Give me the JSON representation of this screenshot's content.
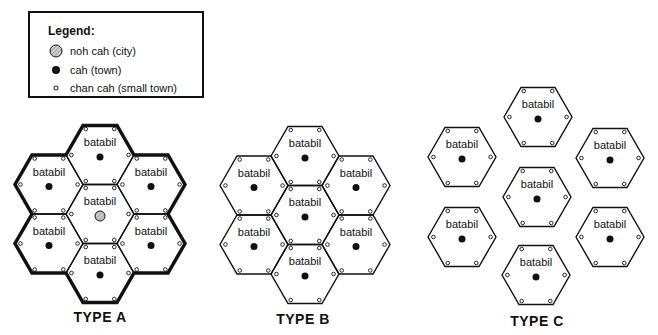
{
  "legend": {
    "title": "Legend:",
    "items": [
      {
        "symbol": "hatched-circle",
        "label": "noh cah (city)"
      },
      {
        "symbol": "filled-dot",
        "label": "cah (town)"
      },
      {
        "symbol": "open-small-circle",
        "label": "chan cah (small town)"
      }
    ]
  },
  "hex_label": "batabil",
  "types": [
    {
      "label": "TYPE A",
      "description": "7 contiguous hexagons, thick outer boundary, central city (noh cah)"
    },
    {
      "label": "TYPE B",
      "description": "7 contiguous hexagons, central town (cah)"
    },
    {
      "label": "TYPE C",
      "description": "7 separated hexagons, each with a town (cah)"
    }
  ],
  "colors": {
    "ink": "#111111",
    "background": "#ffffff",
    "city_fill": "#bdbdbd"
  }
}
